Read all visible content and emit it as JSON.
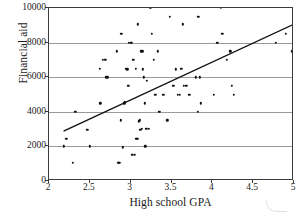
{
  "chart_data": {
    "type": "scatter",
    "title": "",
    "xlabel": "High school GPA",
    "ylabel": "Financial aid",
    "xlim": [
      2,
      5
    ],
    "ylim": [
      0,
      10000
    ],
    "xticks": [
      "2",
      "2.5",
      "3",
      "3.5",
      "4",
      "4.5",
      "5"
    ],
    "xtick_values": [
      2,
      2.5,
      3,
      3.5,
      4,
      4.5,
      5
    ],
    "yticks": [
      "0",
      "2000",
      "4000",
      "6000",
      "8000",
      "10000"
    ],
    "ytick_values": [
      0,
      2000,
      4000,
      6000,
      8000,
      10000
    ],
    "grid": "horizontal",
    "legend": "none",
    "series": [
      {
        "name": "students",
        "marker": "filled-circle",
        "color": "#111111",
        "points": [
          [
            2.18,
            2000
          ],
          [
            2.21,
            2450
          ],
          [
            2.21,
            0
          ],
          [
            2.26,
            0
          ],
          [
            2.29,
            1050
          ],
          [
            2.32,
            4000
          ],
          [
            2.35,
            0
          ],
          [
            2.47,
            2950
          ],
          [
            2.5,
            2000
          ],
          [
            2.52,
            0
          ],
          [
            2.62,
            6500
          ],
          [
            2.63,
            4500
          ],
          [
            2.66,
            7000
          ],
          [
            2.69,
            7000
          ],
          [
            2.7,
            6000
          ],
          [
            2.72,
            6000
          ],
          [
            2.72,
            0
          ],
          [
            2.75,
            0
          ],
          [
            2.83,
            7500
          ],
          [
            2.85,
            1050
          ],
          [
            2.86,
            1050
          ],
          [
            2.88,
            3500
          ],
          [
            2.88,
            8500
          ],
          [
            2.89,
            8500
          ],
          [
            2.9,
            1950
          ],
          [
            2.92,
            4500
          ],
          [
            2.93,
            4550
          ],
          [
            2.94,
            6500
          ],
          [
            2.96,
            6450
          ],
          [
            2.97,
            5500
          ],
          [
            2.98,
            8000
          ],
          [
            3.0,
            8000
          ],
          [
            3.01,
            8000
          ],
          [
            3.02,
            1500
          ],
          [
            3.03,
            7000
          ],
          [
            3.05,
            1500
          ],
          [
            3.06,
            6500
          ],
          [
            3.07,
            2450
          ],
          [
            3.08,
            2450
          ],
          [
            3.09,
            9050
          ],
          [
            3.1,
            3450
          ],
          [
            3.11,
            3500
          ],
          [
            3.12,
            2950
          ],
          [
            3.13,
            7500
          ],
          [
            3.14,
            3000
          ],
          [
            3.15,
            6450
          ],
          [
            3.15,
            7500
          ],
          [
            3.16,
            6000
          ],
          [
            3.17,
            4500
          ],
          [
            3.18,
            2000
          ],
          [
            3.19,
            3000
          ],
          [
            3.2,
            5800
          ],
          [
            3.22,
            3000
          ],
          [
            3.24,
            10000
          ],
          [
            3.26,
            8500
          ],
          [
            3.28,
            7000
          ],
          [
            3.3,
            5000
          ],
          [
            3.33,
            7500
          ],
          [
            3.35,
            4000
          ],
          [
            3.4,
            5000
          ],
          [
            3.45,
            3500
          ],
          [
            3.48,
            9500
          ],
          [
            3.52,
            5500
          ],
          [
            3.55,
            6450
          ],
          [
            3.58,
            5000
          ],
          [
            3.6,
            5000
          ],
          [
            3.62,
            6500
          ],
          [
            3.64,
            9050
          ],
          [
            3.65,
            5500
          ],
          [
            3.68,
            5500
          ],
          [
            3.72,
            5000
          ],
          [
            3.8,
            6000
          ],
          [
            3.82,
            4000
          ],
          [
            3.83,
            9500
          ],
          [
            3.85,
            6000
          ],
          [
            3.86,
            4500
          ],
          [
            4.02,
            5000
          ],
          [
            4.06,
            8000
          ],
          [
            4.1,
            10000
          ],
          [
            4.12,
            8500
          ],
          [
            4.18,
            7000
          ],
          [
            4.22,
            7500
          ],
          [
            4.24,
            5500
          ],
          [
            4.26,
            5000
          ],
          [
            4.78,
            8000
          ],
          [
            4.9,
            8500
          ],
          [
            4.98,
            7500
          ]
        ]
      }
    ],
    "trendline": {
      "type": "linear-fit",
      "color": "#111111",
      "x_start": 2.18,
      "y_start": 2800,
      "x_end": 5.0,
      "y_end": 9000
    }
  }
}
